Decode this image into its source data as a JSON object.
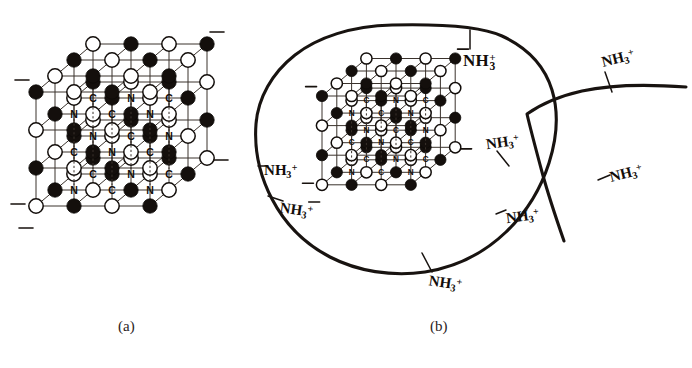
{
  "figure": {
    "panels": [
      {
        "id": "a",
        "caption": "(a)",
        "caption_x": 118,
        "caption_y": 325
      },
      {
        "id": "b",
        "caption": "(b)",
        "caption_x": 430,
        "caption_y": 325
      }
    ]
  },
  "lattice": {
    "description": "cubic crystal lattice, alternating filled and open spheres",
    "atom_labels": [
      "C",
      "N"
    ],
    "charge_label": "minus",
    "node_types": [
      "filled",
      "open"
    ],
    "grid_size": 3,
    "panel_a": {
      "origin_x": 36,
      "origin_y": 92,
      "scale": 1.0,
      "cell": 38,
      "depth_x": 19,
      "depth_y": -16
    },
    "panel_b": {
      "origin_x": 322,
      "origin_y": 96,
      "scale": 0.78,
      "cell": 29.6,
      "depth_x": 14.8,
      "depth_y": -12.5
    },
    "bond_label_rows": [
      [
        "N",
        "C",
        "N"
      ],
      [
        "C",
        "N",
        "C"
      ],
      [
        "C",
        "N",
        "N",
        "C"
      ],
      [
        "C",
        "N",
        "C"
      ],
      [
        "N",
        "C",
        "N"
      ]
    ]
  },
  "membrane": {
    "name": "cell-membrane-outline",
    "open_curve_name": "secondary-membrane-curve",
    "labels": [
      {
        "id": "top",
        "text": "NH3+",
        "base": "NH",
        "sub": "3",
        "sup": "+",
        "stacked": true,
        "x": 463,
        "y": 52,
        "size": 17,
        "rotate": 0,
        "tick": {
          "x1": 470,
          "y1": 30,
          "x2": 470,
          "y2": 49
        }
      },
      {
        "id": "left-upper",
        "text": "NH3+",
        "base": "NH",
        "sub": "3",
        "sup": "+",
        "stacked": false,
        "x": 264,
        "y": 163,
        "size": 15,
        "rotate": 0,
        "tick": {
          "x1": 258,
          "y1": 166,
          "x2": 268,
          "y2": 166
        }
      },
      {
        "id": "left-lower",
        "text": "NH3+",
        "base": "NH",
        "sub": "3",
        "sup": "+",
        "stacked": false,
        "x": 281,
        "y": 200,
        "size": 15,
        "rotate": 8,
        "tick": {
          "x1": 268,
          "y1": 196,
          "x2": 283,
          "y2": 201
        }
      },
      {
        "id": "bottom",
        "text": "NH3+",
        "base": "NH",
        "sub": "3",
        "sup": "+",
        "stacked": false,
        "x": 430,
        "y": 273,
        "size": 15,
        "rotate": 8,
        "tick": {
          "x1": 422,
          "y1": 253,
          "x2": 432,
          "y2": 272
        }
      },
      {
        "id": "right-inner-upper",
        "text": "NH3+",
        "base": "NH",
        "sub": "3",
        "sup": "+",
        "stacked": false,
        "x": 485,
        "y": 137,
        "size": 15,
        "rotate": -8,
        "tick": {
          "x1": 497,
          "y1": 151,
          "x2": 509,
          "y2": 166
        }
      },
      {
        "id": "right-inner-lower",
        "text": "NH3+",
        "base": "NH",
        "sub": "3",
        "sup": "+",
        "stacked": false,
        "x": 505,
        "y": 211,
        "size": 15,
        "rotate": -8,
        "tick": {
          "x1": 496,
          "y1": 214,
          "x2": 506,
          "y2": 210
        }
      },
      {
        "id": "right-outer-top",
        "text": "NH3+",
        "base": "NH",
        "sub": "3",
        "sup": "+",
        "stacked": false,
        "x": 600,
        "y": 55,
        "size": 15,
        "rotate": -14,
        "tick": {
          "x1": 605,
          "y1": 72,
          "x2": 612,
          "y2": 92
        }
      },
      {
        "id": "right-outer-bottom",
        "text": "NH3+",
        "base": "NH",
        "sub": "3",
        "sup": "+",
        "stacked": false,
        "x": 608,
        "y": 170,
        "size": 15,
        "rotate": -14,
        "tick": {
          "x1": 598,
          "y1": 180,
          "x2": 610,
          "y2": 175
        }
      }
    ]
  }
}
